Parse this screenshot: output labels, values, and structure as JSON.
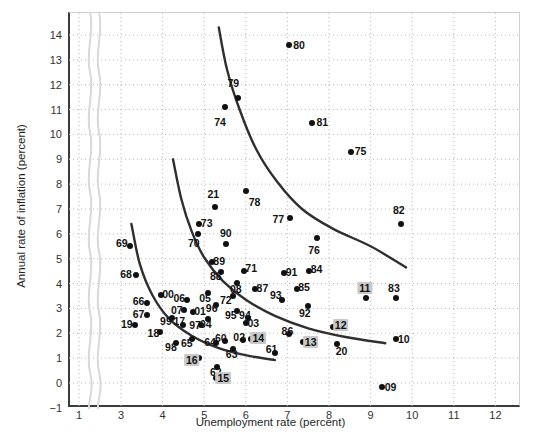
{
  "chart_data": {
    "type": "scatter",
    "title": "",
    "xlabel": "Unemployment rate (percent)",
    "ylabel": "Annual rate of inflation (percent)",
    "xlim": [
      0.5,
      12.6
    ],
    "ylim": [
      -1,
      14.8
    ],
    "xticks": [
      1,
      3,
      4,
      5,
      6,
      7,
      8,
      9,
      10,
      11,
      12
    ],
    "yticks": [
      -1,
      0,
      1,
      2,
      3,
      4,
      5,
      6,
      7,
      8,
      9,
      10,
      11,
      12,
      13,
      14
    ],
    "axis_break_after_x": 1,
    "grid": true,
    "grid_style": "dotted",
    "legend": "none",
    "point_label_position": "varies",
    "points": [
      {
        "label": "80",
        "x": 7.05,
        "y": 13.6,
        "lx": 7.28,
        "ly": 13.6,
        "hi": false
      },
      {
        "label": "79",
        "x": 5.82,
        "y": 11.45,
        "lx": 5.7,
        "ly": 12.05,
        "hi": false
      },
      {
        "label": "74",
        "x": 5.5,
        "y": 11.1,
        "lx": 5.38,
        "ly": 10.5,
        "hi": false
      },
      {
        "label": "81",
        "x": 7.6,
        "y": 10.45,
        "lx": 7.84,
        "ly": 10.5,
        "hi": false
      },
      {
        "label": "75",
        "x": 8.52,
        "y": 9.3,
        "lx": 8.76,
        "ly": 9.35,
        "hi": false
      },
      {
        "label": "78",
        "x": 6.0,
        "y": 7.72,
        "lx": 6.21,
        "ly": 7.28,
        "hi": false
      },
      {
        "label": "21",
        "x": 5.27,
        "y": 7.08,
        "lx": 5.22,
        "ly": 7.62,
        "hi": false
      },
      {
        "label": "77",
        "x": 7.07,
        "y": 6.62,
        "lx": 6.78,
        "ly": 6.6,
        "hi": false
      },
      {
        "label": "82",
        "x": 9.72,
        "y": 6.4,
        "lx": 9.68,
        "ly": 6.95,
        "hi": false
      },
      {
        "label": "73",
        "x": 4.88,
        "y": 6.4,
        "lx": 5.06,
        "ly": 6.45,
        "hi": false
      },
      {
        "label": "70",
        "x": 4.85,
        "y": 5.98,
        "lx": 4.75,
        "ly": 5.62,
        "hi": false
      },
      {
        "label": "76",
        "x": 7.7,
        "y": 5.82,
        "lx": 7.64,
        "ly": 5.36,
        "hi": false
      },
      {
        "label": "90",
        "x": 5.52,
        "y": 5.6,
        "lx": 5.52,
        "ly": 6.02,
        "hi": false
      },
      {
        "label": "69",
        "x": 3.22,
        "y": 5.52,
        "lx": 3.02,
        "ly": 5.62,
        "hi": false
      },
      {
        "label": "89",
        "x": 5.18,
        "y": 4.88,
        "lx": 5.36,
        "ly": 4.92,
        "hi": false
      },
      {
        "label": "71",
        "x": 5.95,
        "y": 4.52,
        "lx": 6.13,
        "ly": 4.62,
        "hi": false
      },
      {
        "label": "84",
        "x": 7.52,
        "y": 4.52,
        "lx": 7.7,
        "ly": 4.6,
        "hi": false
      },
      {
        "label": "88",
        "x": 5.4,
        "y": 4.45,
        "lx": 5.28,
        "ly": 4.32,
        "hi": false
      },
      {
        "label": "91",
        "x": 6.92,
        "y": 4.42,
        "lx": 7.1,
        "ly": 4.45,
        "hi": false
      },
      {
        "label": "68",
        "x": 3.35,
        "y": 4.35,
        "lx": 3.12,
        "ly": 4.4,
        "hi": false
      },
      {
        "label": "08",
        "x": 5.8,
        "y": 4.02,
        "lx": 5.76,
        "ly": 3.78,
        "hi": false
      },
      {
        "label": "87",
        "x": 6.22,
        "y": 3.8,
        "lx": 6.4,
        "ly": 3.82,
        "hi": false
      },
      {
        "label": "85",
        "x": 7.22,
        "y": 3.78,
        "lx": 7.4,
        "ly": 3.88,
        "hi": false
      },
      {
        "label": "05",
        "x": 5.08,
        "y": 3.62,
        "lx": 5.02,
        "ly": 3.4,
        "hi": false
      },
      {
        "label": "00",
        "x": 3.95,
        "y": 3.54,
        "lx": 4.13,
        "ly": 3.58,
        "hi": false
      },
      {
        "label": "72",
        "x": 5.7,
        "y": 3.48,
        "lx": 5.52,
        "ly": 3.32,
        "hi": false
      },
      {
        "label": "11",
        "x": 8.9,
        "y": 3.4,
        "lx": 8.86,
        "ly": 3.82,
        "hi": true
      },
      {
        "label": "83",
        "x": 9.6,
        "y": 3.4,
        "lx": 9.56,
        "ly": 3.84,
        "hi": false
      },
      {
        "label": "93",
        "x": 6.86,
        "y": 3.35,
        "lx": 6.72,
        "ly": 3.52,
        "hi": false
      },
      {
        "label": "06",
        "x": 4.58,
        "y": 3.34,
        "lx": 4.4,
        "ly": 3.4,
        "hi": false
      },
      {
        "label": "96",
        "x": 5.28,
        "y": 3.12,
        "lx": 5.18,
        "ly": 3.02,
        "hi": false
      },
      {
        "label": "66",
        "x": 3.62,
        "y": 3.2,
        "lx": 3.42,
        "ly": 3.28,
        "hi": false
      },
      {
        "label": "92",
        "x": 7.5,
        "y": 3.08,
        "lx": 7.42,
        "ly": 2.8,
        "hi": false
      },
      {
        "label": "07",
        "x": 4.52,
        "y": 2.92,
        "lx": 4.34,
        "ly": 2.95,
        "hi": false
      },
      {
        "label": "95",
        "x": 5.8,
        "y": 2.9,
        "lx": 5.64,
        "ly": 2.72,
        "hi": false
      },
      {
        "label": "01",
        "x": 4.72,
        "y": 2.86,
        "lx": 4.9,
        "ly": 2.9,
        "hi": false
      },
      {
        "label": "67",
        "x": 3.62,
        "y": 2.72,
        "lx": 3.42,
        "ly": 2.78,
        "hi": false
      },
      {
        "label": "99",
        "x": 4.22,
        "y": 2.62,
        "lx": 4.08,
        "ly": 2.48,
        "hi": false
      },
      {
        "label": "04",
        "x": 5.1,
        "y": 2.58,
        "lx": 5.04,
        "ly": 2.38,
        "hi": false
      },
      {
        "label": "94",
        "x": 6.05,
        "y": 2.62,
        "lx": 5.98,
        "ly": 2.72,
        "hi": false
      },
      {
        "label": "03",
        "x": 6.0,
        "y": 2.4,
        "lx": 6.18,
        "ly": 2.42,
        "hi": false
      },
      {
        "label": "17",
        "x": 4.48,
        "y": 2.32,
        "lx": 4.4,
        "ly": 2.48,
        "hi": false
      },
      {
        "label": "19",
        "x": 3.34,
        "y": 2.34,
        "lx": 3.14,
        "ly": 2.36,
        "hi": false
      },
      {
        "label": "97",
        "x": 4.92,
        "y": 2.34,
        "lx": 4.78,
        "ly": 2.34,
        "hi": false
      },
      {
        "label": "86",
        "x": 7.05,
        "y": 1.98,
        "lx": 7.0,
        "ly": 2.1,
        "hi": false
      },
      {
        "label": "18",
        "x": 3.94,
        "y": 2.05,
        "lx": 3.78,
        "ly": 2.0,
        "hi": false
      },
      {
        "label": "65",
        "x": 4.7,
        "y": 1.76,
        "lx": 4.58,
        "ly": 1.62,
        "hi": false
      },
      {
        "label": "10",
        "x": 9.6,
        "y": 1.76,
        "lx": 9.8,
        "ly": 1.78,
        "hi": false
      },
      {
        "label": "12",
        "x": 8.1,
        "y": 2.25,
        "lx": 8.28,
        "ly": 2.32,
        "hi": true
      },
      {
        "label": "60",
        "x": 5.5,
        "y": 1.68,
        "lx": 5.4,
        "ly": 1.82,
        "hi": false
      },
      {
        "label": "02",
        "x": 5.94,
        "y": 1.72,
        "lx": 5.84,
        "ly": 1.86,
        "hi": false
      },
      {
        "label": "13",
        "x": 7.38,
        "y": 1.65,
        "lx": 7.56,
        "ly": 1.66,
        "hi": true
      },
      {
        "label": "14",
        "x": 6.12,
        "y": 1.75,
        "lx": 6.3,
        "ly": 1.82,
        "hi": true
      },
      {
        "label": "64",
        "x": 5.28,
        "y": 1.6,
        "lx": 5.14,
        "ly": 1.64,
        "hi": false
      },
      {
        "label": "98",
        "x": 4.32,
        "y": 1.6,
        "lx": 4.2,
        "ly": 1.46,
        "hi": false
      },
      {
        "label": "20",
        "x": 8.2,
        "y": 1.56,
        "lx": 8.3,
        "ly": 1.3,
        "hi": false
      },
      {
        "label": "63",
        "x": 5.7,
        "y": 1.36,
        "lx": 5.66,
        "ly": 1.16,
        "hi": false
      },
      {
        "label": "61",
        "x": 6.7,
        "y": 1.2,
        "lx": 6.62,
        "ly": 1.38,
        "hi": false
      },
      {
        "label": "16",
        "x": 4.88,
        "y": 1.0,
        "lx": 4.7,
        "ly": 0.92,
        "hi": true
      },
      {
        "label": "62",
        "x": 5.3,
        "y": 0.66,
        "lx": 5.28,
        "ly": 0.46,
        "hi": false
      },
      {
        "label": "15",
        "x": 5.28,
        "y": 0.22,
        "lx": 5.46,
        "ly": 0.22,
        "hi": true
      },
      {
        "label": "09",
        "x": 9.28,
        "y": -0.18,
        "lx": 9.48,
        "ly": -0.16,
        "hi": false
      }
    ],
    "curves": [
      {
        "name": "phillips-curve-1970s",
        "points": [
          [
            5.35,
            14.3
          ],
          [
            5.55,
            12.6
          ],
          [
            5.85,
            11.0
          ],
          [
            6.25,
            9.4
          ],
          [
            6.75,
            8.1
          ],
          [
            7.35,
            7.0
          ],
          [
            8.1,
            6.2
          ],
          [
            9.0,
            5.5
          ],
          [
            9.85,
            4.65
          ]
        ]
      },
      {
        "name": "phillips-curve-1960s-80s",
        "points": [
          [
            4.25,
            9.0
          ],
          [
            4.45,
            7.4
          ],
          [
            4.7,
            6.1
          ],
          [
            5.0,
            5.05
          ],
          [
            5.45,
            4.1
          ],
          [
            6.0,
            3.35
          ],
          [
            6.7,
            2.7
          ],
          [
            7.5,
            2.2
          ],
          [
            8.4,
            1.85
          ],
          [
            9.35,
            1.6
          ]
        ]
      },
      {
        "name": "phillips-curve-recent",
        "points": [
          [
            3.25,
            6.4
          ],
          [
            3.45,
            4.8
          ],
          [
            3.75,
            3.55
          ],
          [
            4.15,
            2.6
          ],
          [
            4.7,
            1.9
          ],
          [
            5.35,
            1.4
          ],
          [
            6.05,
            1.1
          ],
          [
            6.7,
            0.92
          ]
        ]
      }
    ]
  }
}
